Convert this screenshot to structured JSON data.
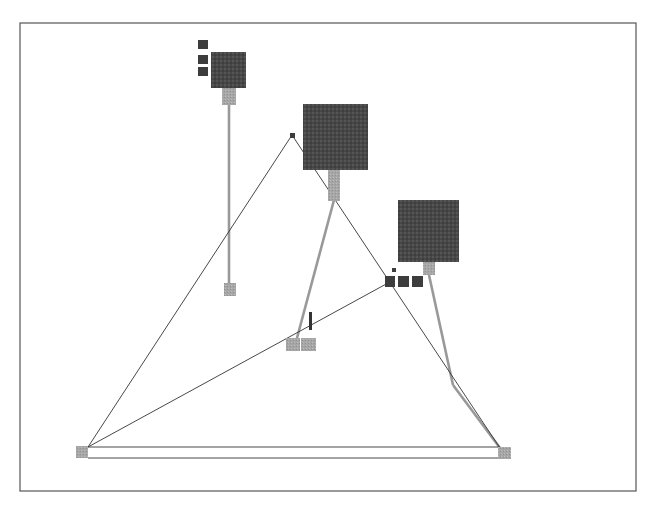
{
  "diagram": {
    "type": "node-link network",
    "frame": {
      "x": 20,
      "y": 23,
      "w": 616,
      "h": 468,
      "stroke": "#555555"
    },
    "colors": {
      "node_dark": "#4a4a4a",
      "node_light": "#a9a9a9",
      "edge_dark": "#333333",
      "edge_gray": "#999999"
    },
    "large_nodes": [
      {
        "id": "node-a",
        "x": 211,
        "y": 52,
        "w": 35,
        "h": 36
      },
      {
        "id": "node-b",
        "x": 303,
        "y": 104,
        "w": 65,
        "h": 66
      },
      {
        "id": "node-c",
        "x": 398,
        "y": 200,
        "w": 61,
        "h": 62
      }
    ],
    "connectors": [
      {
        "id": "conn-a",
        "x": 222,
        "y": 88,
        "w": 14,
        "h": 17
      },
      {
        "id": "conn-b",
        "x": 328,
        "y": 170,
        "w": 12,
        "h": 31
      },
      {
        "id": "conn-c",
        "x": 423,
        "y": 262,
        "w": 12,
        "h": 13
      }
    ],
    "small_dark_nodes": [
      {
        "x": 198,
        "y": 40,
        "w": 10,
        "h": 9
      },
      {
        "x": 198,
        "y": 55,
        "w": 10,
        "h": 9
      },
      {
        "x": 198,
        "y": 67,
        "w": 10,
        "h": 9
      },
      {
        "x": 385,
        "y": 276,
        "w": 10,
        "h": 11
      },
      {
        "x": 398,
        "y": 276,
        "w": 11,
        "h": 11
      },
      {
        "x": 412,
        "y": 276,
        "w": 11,
        "h": 11
      },
      {
        "x": 392,
        "y": 268,
        "w": 4,
        "h": 4
      },
      {
        "x": 290,
        "y": 133,
        "w": 5,
        "h": 5
      }
    ],
    "light_anchors": [
      {
        "x": 224,
        "y": 283,
        "w": 12,
        "h": 13
      },
      {
        "x": 286,
        "y": 338,
        "w": 14,
        "h": 13
      },
      {
        "x": 301,
        "y": 338,
        "w": 15,
        "h": 13
      },
      {
        "x": 76,
        "y": 446,
        "w": 12,
        "h": 12
      },
      {
        "x": 498,
        "y": 447,
        "w": 13,
        "h": 12
      }
    ],
    "figure_marker": {
      "x": 309,
      "y": 312,
      "w": 3,
      "h": 18
    },
    "edges_dark": [
      {
        "x1": 292,
        "y1": 135,
        "x2": 88,
        "y2": 447
      },
      {
        "x1": 292,
        "y1": 135,
        "x2": 500,
        "y2": 448
      },
      {
        "x1": 388,
        "y1": 283,
        "x2": 88,
        "y2": 447
      },
      {
        "x1": 88,
        "y1": 447,
        "x2": 500,
        "y2": 447
      },
      {
        "x1": 88,
        "y1": 458,
        "x2": 500,
        "y2": 458
      }
    ],
    "edges_gray": [
      {
        "x1": 229,
        "y1": 105,
        "x2": 229,
        "y2": 283
      },
      {
        "x1": 334,
        "y1": 200,
        "x2": 297,
        "y2": 338
      },
      {
        "x1": 429,
        "y1": 275,
        "x2": 453,
        "y2": 385
      },
      {
        "x1": 453,
        "y1": 385,
        "x2": 500,
        "y2": 448
      }
    ]
  }
}
